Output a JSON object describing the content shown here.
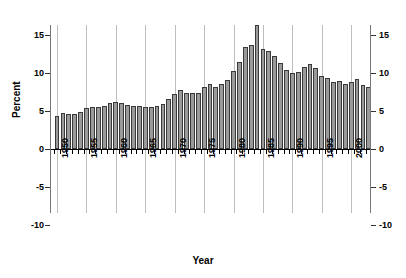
{
  "chart_data": {
    "type": "bar",
    "title": "",
    "xlabel": "Year",
    "ylabel": "Percent",
    "ylim": [
      -10,
      17
    ],
    "xlim": [
      1949.3,
      2003.7
    ],
    "grid": "vertical gridlines at 5-year x ticks",
    "legend": "none",
    "y_ticks": [
      15,
      10,
      5,
      0,
      -5,
      -10
    ],
    "y_tick_labels_left": [
      "15",
      "10",
      "5",
      "0",
      "-5",
      "-10"
    ],
    "y_tick_labels_right": [
      "15",
      "10",
      "5",
      "0",
      "-5",
      "-10"
    ],
    "x_ticks": [
      1950,
      1955,
      1960,
      1965,
      1970,
      1975,
      1980,
      1985,
      1990,
      1995,
      2000
    ],
    "x_tick_labels": [
      "1950",
      "1955",
      "1960",
      "1965",
      "1970",
      "1975",
      "1980",
      "1985",
      "1990",
      "1995",
      "2000"
    ],
    "bar_color": "#9a9a9a",
    "bar_edge_color": "#3a3a3a",
    "axis_color": "#777777",
    "gridline_color": "#bdbdbd",
    "categories": [
      1950,
      1951,
      1952,
      1953,
      1954,
      1955,
      1956,
      1957,
      1958,
      1959,
      1960,
      1961,
      1962,
      1963,
      1964,
      1965,
      1966,
      1967,
      1968,
      1969,
      1970,
      1971,
      1972,
      1973,
      1974,
      1975,
      1976,
      1977,
      1978,
      1979,
      1980,
      1981,
      1982,
      1983,
      1984,
      1985,
      1986,
      1987,
      1988,
      1989,
      1990,
      1991,
      1992,
      1993,
      1994,
      1995,
      1996,
      1997,
      1998,
      1999,
      2000,
      2001,
      2002,
      2003
    ],
    "values": [
      4.4,
      4.8,
      4.6,
      4.6,
      4.9,
      5.4,
      5.5,
      5.5,
      5.6,
      6.1,
      6.2,
      6.1,
      5.8,
      5.6,
      5.6,
      5.5,
      5.5,
      5.6,
      5.9,
      6.6,
      7.3,
      7.7,
      7.4,
      7.4,
      7.4,
      8.2,
      8.6,
      8.1,
      8.5,
      9.1,
      10.2,
      11.4,
      13.4,
      13.7,
      16.3,
      13.2,
      12.9,
      12.3,
      11.3,
      10.4,
      10.0,
      10.1,
      10.8,
      11.2,
      10.7,
      9.6,
      9.3,
      8.8,
      8.9,
      8.6,
      8.8,
      9.2,
      8.4,
      8.1
    ],
    "value_unit": "percent",
    "n_bars": 54
  }
}
